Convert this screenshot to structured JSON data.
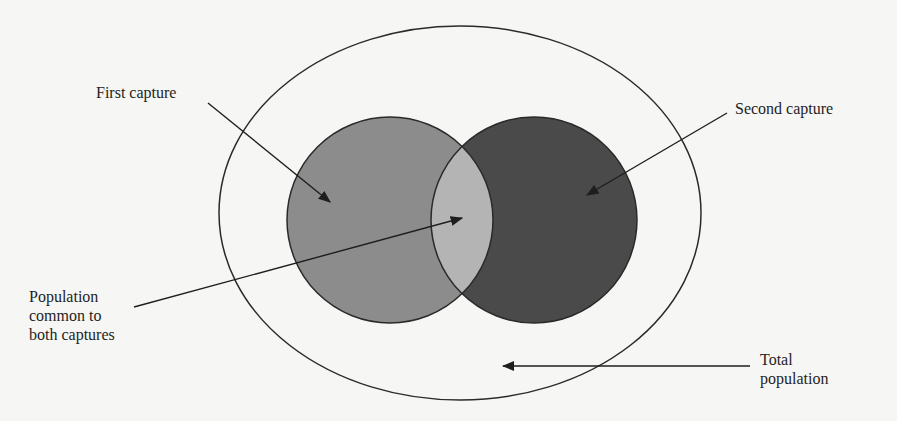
{
  "diagram": {
    "type": "venn-capture-recapture",
    "labels": {
      "first_capture": "First capture",
      "second_capture": "Second capture",
      "common": "Population\ncommon to\nboth captures",
      "total": "Total\npopulation"
    },
    "shapes": {
      "total_population": {
        "kind": "ellipse",
        "cx": 460,
        "cy": 213,
        "rx": 241,
        "ry": 187,
        "fill": "#f6f6f4",
        "stroke": "#2a2a2a"
      },
      "first_capture": {
        "kind": "circle",
        "cx": 390,
        "cy": 220,
        "r": 103,
        "fill": "#8c8c8c",
        "stroke": "#2a2a2a"
      },
      "second_capture": {
        "kind": "circle",
        "cx": 534,
        "cy": 220,
        "r": 103,
        "fill": "#4a4a4a",
        "stroke": "#2a2a2a"
      },
      "overlap": {
        "kind": "lens",
        "fill": "#b4b4b4"
      }
    },
    "arrows": [
      {
        "name": "first-capture-arrow",
        "from": [
          208,
          103
        ],
        "to": [
          330,
          202
        ]
      },
      {
        "name": "second-capture-arrow",
        "from": [
          727,
          113
        ],
        "to": [
          587,
          195
        ]
      },
      {
        "name": "common-arrow",
        "from": [
          134,
          307
        ],
        "to": [
          462,
          218
        ]
      },
      {
        "name": "total-arrow",
        "from": [
          750,
          366
        ],
        "to": [
          503,
          366
        ]
      }
    ]
  }
}
